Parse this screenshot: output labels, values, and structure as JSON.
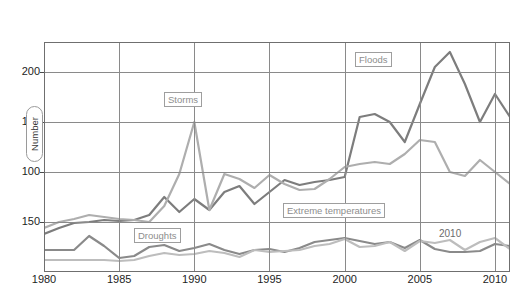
{
  "chart_data": {
    "type": "line",
    "title": "",
    "subtitle": "",
    "xlabel": "",
    "ylabel": "Number",
    "xlim": [
      1980,
      2011
    ],
    "ylim": [
      0,
      230
    ],
    "grid": true,
    "legend_position": "inline-callout-labels",
    "y_tick_labels": [
      "200",
      "150",
      "100",
      "150"
    ],
    "y_tick_values": [
      200,
      150,
      100,
      50
    ],
    "x_tick_labels": [
      "1980",
      "1985",
      "1990",
      "1995",
      "2000",
      "2005",
      "2010"
    ],
    "x_tick_values": [
      1980,
      1985,
      1990,
      1995,
      2000,
      2005,
      2010
    ],
    "x": [
      1980,
      1981,
      1982,
      1983,
      1984,
      1985,
      1986,
      1987,
      1988,
      1989,
      1990,
      1991,
      1992,
      1993,
      1994,
      1995,
      1996,
      1997,
      1998,
      1999,
      2000,
      2001,
      2002,
      2003,
      2004,
      2005,
      2006,
      2007,
      2008,
      2009,
      2010,
      2011
    ],
    "series": [
      {
        "name": "Floods",
        "color": "#7d7d7d",
        "values": [
          38,
          44,
          49,
          50,
          52,
          51,
          52,
          57,
          75,
          60,
          73,
          62,
          80,
          86,
          68,
          80,
          92,
          87,
          90,
          92,
          95,
          155,
          158,
          150,
          130,
          168,
          205,
          220,
          188,
          150,
          178,
          155
        ]
      },
      {
        "name": "Storms",
        "color": "#aeaeae",
        "values": [
          44,
          50,
          53,
          57,
          55,
          53,
          52,
          50,
          66,
          98,
          150,
          62,
          98,
          93,
          84,
          97,
          88,
          82,
          83,
          93,
          105,
          108,
          110,
          108,
          118,
          132,
          130,
          100,
          96,
          112,
          100,
          88
        ]
      },
      {
        "name": "Droughts",
        "color": "#8a8a8a",
        "values": [
          22,
          22,
          22,
          36,
          26,
          14,
          16,
          25,
          27,
          21,
          24,
          28,
          22,
          18,
          22,
          23,
          20,
          24,
          30,
          32,
          34,
          31,
          28,
          30,
          24,
          32,
          23,
          20,
          20,
          21,
          28,
          26
        ]
      },
      {
        "name": "Extreme temperatures",
        "color": "#bdbdbd",
        "values": [
          12,
          12,
          12,
          12,
          12,
          11,
          12,
          16,
          19,
          17,
          18,
          21,
          19,
          15,
          22,
          20,
          21,
          22,
          26,
          28,
          33,
          25,
          26,
          30,
          21,
          31,
          29,
          32,
          22,
          30,
          34,
          23
        ]
      }
    ],
    "annotations": [
      {
        "name": "Floods",
        "text": "Floods",
        "kind": "boxed-callout"
      },
      {
        "name": "Storms",
        "text": "Storms",
        "kind": "boxed-callout"
      },
      {
        "name": "Droughts",
        "text": "Droughts",
        "kind": "boxed-callout"
      },
      {
        "name": "Extreme temperatures",
        "text": "Extreme temperatures",
        "kind": "boxed-callout"
      },
      {
        "name": "year-2010",
        "text": "2010",
        "kind": "plain-text"
      }
    ]
  },
  "labels": {
    "floods": "Floods",
    "storms": "Storms",
    "droughts": "Droughts",
    "extreme_temperatures": "Extreme temperatures",
    "year_2010": "2010",
    "y_axis_title": "Number"
  },
  "colors": {
    "floods": "#7d7d7d",
    "storms": "#aeaeae",
    "droughts": "#8a8a8a",
    "extreme_temperatures": "#bdbdbd",
    "grid": "#8a8a8a",
    "frame": "#6f6f6f",
    "text": "#1d1d1d"
  }
}
